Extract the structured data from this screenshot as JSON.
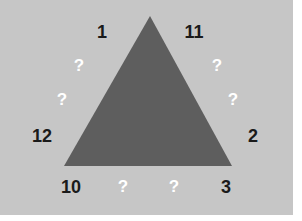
{
  "puzzle": {
    "shape": "triangle",
    "colors": {
      "background": "#c6c6c6",
      "triangle": "#5e5e5e",
      "number": "#1a1a1a",
      "unknown": "#ffffff"
    },
    "triangle_points": [
      [
        150,
        16
      ],
      [
        64,
        166
      ],
      [
        232,
        166
      ]
    ],
    "labels": [
      {
        "id": "n1",
        "text": "1",
        "x": 102,
        "y": 32,
        "kind": "num"
      },
      {
        "id": "n11",
        "text": "11",
        "x": 194,
        "y": 32,
        "kind": "num"
      },
      {
        "id": "q-left-upper",
        "text": "?",
        "x": 79,
        "y": 66,
        "kind": "q"
      },
      {
        "id": "q-right-upper",
        "text": "?",
        "x": 217,
        "y": 66,
        "kind": "q"
      },
      {
        "id": "q-left-lower",
        "text": "?",
        "x": 62,
        "y": 100,
        "kind": "q"
      },
      {
        "id": "q-right-lower",
        "text": "?",
        "x": 233,
        "y": 100,
        "kind": "q"
      },
      {
        "id": "n12",
        "text": "12",
        "x": 42,
        "y": 136,
        "kind": "num"
      },
      {
        "id": "n2",
        "text": "2",
        "x": 253,
        "y": 136,
        "kind": "num"
      },
      {
        "id": "n10",
        "text": "10",
        "x": 71,
        "y": 187,
        "kind": "num"
      },
      {
        "id": "q-bottom-left",
        "text": "?",
        "x": 123,
        "y": 187,
        "kind": "q"
      },
      {
        "id": "q-bottom-right",
        "text": "?",
        "x": 174,
        "y": 187,
        "kind": "q"
      },
      {
        "id": "n3",
        "text": "3",
        "x": 226,
        "y": 187,
        "kind": "num"
      }
    ]
  }
}
